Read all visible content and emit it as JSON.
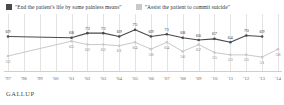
{
  "legend": {
    "items": [
      {
        "label": "\"End the patient's life by some painless means\"",
        "color": "#4a4a4a",
        "icon": "legend-swatch-icon"
      },
      {
        "label": "\"Assist the patient to commit suicide\"",
        "color": "#c9c9c9",
        "icon": "legend-swatch-icon"
      }
    ]
  },
  "footer": {
    "brand": "GALLUP"
  },
  "chart_data": {
    "type": "line",
    "title": "",
    "xlabel": "",
    "ylabel": "",
    "ylim": [
      45,
      80
    ],
    "grid": true,
    "legend_position": "top",
    "categories": [
      "'97",
      "'98",
      "'99",
      "'00",
      "'01",
      "'02",
      "'03",
      "'04",
      "'05",
      "'06",
      "'07",
      "'08",
      "'09",
      "'10",
      "'11",
      "'12",
      "'13",
      "'14"
    ],
    "series": [
      {
        "name": "\"End the patient's life by some painless means\"",
        "color": "#4a4a4a",
        "values": [
          69,
          null,
          null,
          null,
          68,
          72,
          72,
          69,
          75,
          69,
          71,
          68,
          66,
          67,
          64,
          70,
          69,
          null
        ],
        "labels": [
          "69",
          "",
          "",
          "",
          "68",
          "72",
          "72",
          "69",
          "75",
          "69",
          "71",
          "68",
          "66",
          "67",
          "64",
          "70",
          "69",
          ""
        ]
      },
      {
        "name": "\"Assist the patient to commit suicide\"",
        "color": "#c9c9c9",
        "values": [
          52,
          null,
          null,
          null,
          65,
          62,
          62,
          61,
          64,
          58,
          64,
          56,
          62,
          55,
          53,
          53,
          51,
          58
        ],
        "labels": [
          "52",
          "",
          "",
          "",
          "65",
          "62",
          "62",
          "61",
          "64",
          "58",
          "64",
          "56",
          "62",
          "55",
          "53",
          "53",
          "51",
          "58"
        ]
      }
    ]
  }
}
